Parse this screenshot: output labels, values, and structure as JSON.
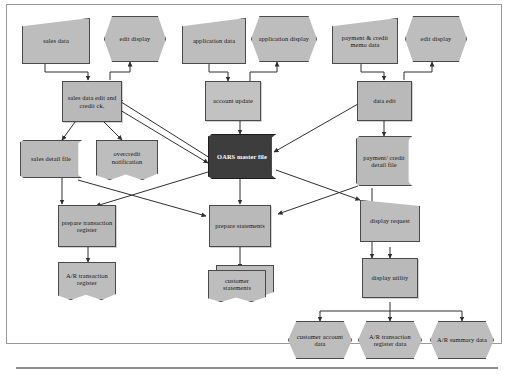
{
  "figure": {
    "frame_color": "#9a9a9a",
    "node_fill": "#bdbdbd",
    "master_file_fill": "#3d3d3d",
    "line_color": "#3a3a3a"
  },
  "nodes": {
    "sales_data": "sales data",
    "edit_display_left": "edit display",
    "application_data": "application data",
    "application_display": "application display",
    "payment_credit_memo_data": "payment & credit memo data",
    "edit_display_right": "edit display",
    "sales_data_edit_credit_ck": "sales data edit and credit ck.",
    "account_update": "account update",
    "data_edit": "data edit",
    "sales_detail_file": "sales detail file",
    "overcredit_notification": "overcredit notification",
    "oars_master_file": "OARS master file",
    "payment_credit_detail_file": "payment/ credit detail file",
    "prepare_transaction_register": "prepare transaction register",
    "prepare_statements": "prepare statements",
    "display_request": "display request",
    "ar_transaction_register": "A/R transaction register",
    "customer_statements": "customer statements",
    "display_utility": "display utility",
    "customer_account_data": "customer account data",
    "ar_transaction_register_data": "A/R transaction register data",
    "ar_summary_data": "A/R summary data"
  }
}
